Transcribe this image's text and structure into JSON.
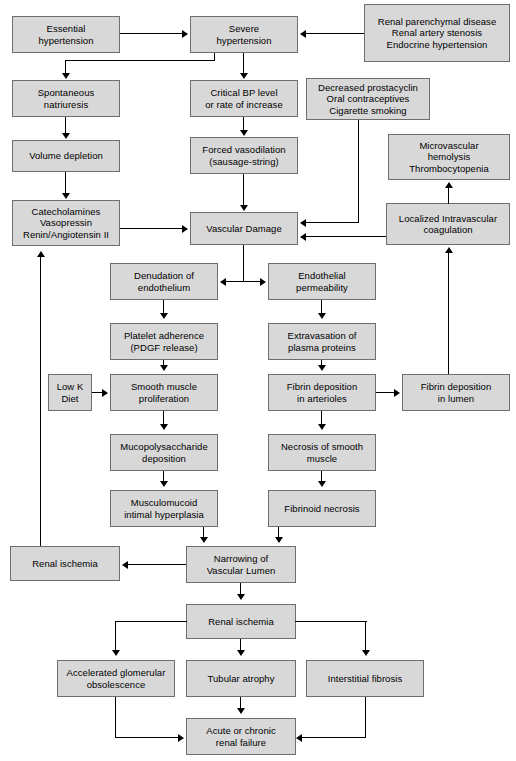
{
  "diagram": {
    "type": "flowchart",
    "canvas": {
      "width": 516,
      "height": 761
    },
    "style": {
      "node_fill": "#d8d8d8",
      "node_border": "#6e6e6e",
      "text_color": "#000000",
      "connector_color": "#000000",
      "background": "#ffffff"
    },
    "nodes": [
      {
        "id": "essential_hypertension",
        "label": "Essential\nhypertension",
        "lines": [
          "Essential",
          "hypertension"
        ]
      },
      {
        "id": "severe_hypertension",
        "label": "Severe\nhypertension",
        "lines": [
          "Severe",
          "hypertension"
        ]
      },
      {
        "id": "renal_causes",
        "label": "Renal parenchymal disease\nRenal artery stenosis\nEndocrine hypertension",
        "lines": [
          "Renal parenchymal disease",
          "Renal artery stenosis",
          "Endocrine hypertension"
        ]
      },
      {
        "id": "spontaneous_natriuresis",
        "label": "Spontaneous\nnatriuresis",
        "lines": [
          "Spontaneous",
          "natriuresis"
        ]
      },
      {
        "id": "critical_bp",
        "label": "Critical BP level\nor rate of increase",
        "lines": [
          "Critical BP level",
          "or rate of increase"
        ]
      },
      {
        "id": "decreased_prostacyclin",
        "label": "Decreased prostacyclin\nOral contraceptives\nCigarette smoking",
        "lines": [
          "Decreased prostacyclin",
          "Oral contraceptives",
          "Cigarette smoking"
        ]
      },
      {
        "id": "volume_depletion",
        "label": "Volume depletion",
        "lines": [
          "Volume depletion"
        ]
      },
      {
        "id": "forced_vasodilation",
        "label": "Forced vasodilation\n(sausage-string)",
        "lines": [
          "Forced vasodilation",
          "(sausage-string)"
        ]
      },
      {
        "id": "microvascular_hemolysis",
        "label": "Microvascular\nhemolysis\nThrombocytopenia",
        "lines": [
          "Microvascular",
          "hemolysis",
          "Thrombocytopenia"
        ]
      },
      {
        "id": "catecholamines",
        "label": "Catecholamines\nVasopressin\nRenin/Angiotensin II",
        "lines": [
          "Catecholamines",
          "Vasopressin",
          "Renin/Angiotensin II"
        ]
      },
      {
        "id": "vascular_damage",
        "label": "Vascular Damage",
        "lines": [
          "Vascular Damage"
        ]
      },
      {
        "id": "localized_intravascular_coagulation",
        "label": "Localized Intravascular\ncoagulation",
        "lines": [
          "Localized Intravascular",
          "coagulation"
        ]
      },
      {
        "id": "denudation_endothelium",
        "label": "Denudation of\nendothelium",
        "lines": [
          "Denudation of",
          "endothelium"
        ]
      },
      {
        "id": "endothelial_permeability",
        "label": "Endothelial\npermeability",
        "lines": [
          "Endothelial",
          "permeability"
        ]
      },
      {
        "id": "platelet_adherence",
        "label": "Platelet adherence\n(PDGF release)",
        "lines": [
          "Platelet adherence",
          "(PDGF release)"
        ]
      },
      {
        "id": "extravasation_plasma_proteins",
        "label": "Extravasation of\nplasma proteins",
        "lines": [
          "Extravasation of",
          "plasma proteins"
        ]
      },
      {
        "id": "low_k_diet",
        "label": "Low K\nDiet",
        "lines": [
          "Low K",
          "Diet"
        ]
      },
      {
        "id": "smooth_muscle_proliferation",
        "label": "Smooth muscle\nproliferation",
        "lines": [
          "Smooth muscle",
          "proliferation"
        ]
      },
      {
        "id": "fibrin_deposition_arterioles",
        "label": "Fibrin deposition\nin arterioles",
        "lines": [
          "Fibrin deposition",
          "in arterioles"
        ]
      },
      {
        "id": "fibrin_deposition_lumen",
        "label": "Fibrin deposition\nin lumen",
        "lines": [
          "Fibrin deposition",
          "in lumen"
        ]
      },
      {
        "id": "mucopolysaccharide_deposition",
        "label": "Mucopolysaccharide\ndeposition",
        "lines": [
          "Mucopolysaccharide",
          "deposition"
        ]
      },
      {
        "id": "necrosis_smooth_muscle",
        "label": "Necrosis of smooth\nmuscle",
        "lines": [
          "Necrosis of smooth",
          "muscle"
        ]
      },
      {
        "id": "musculomucoid_intimal_hyperplasia",
        "label": "Musculomucoid\nintimal hyperplasia",
        "lines": [
          "Musculomucoid",
          "intimal hyperplasia"
        ]
      },
      {
        "id": "fibrinoid_necrosis",
        "label": "Fibrinoid necrosis",
        "lines": [
          "Fibrinoid necrosis"
        ]
      },
      {
        "id": "renal_ischemia_left",
        "label": "Renal ischemia",
        "lines": [
          "Renal ischemia"
        ]
      },
      {
        "id": "narrowing_vascular_lumen",
        "label": "Narrowing of\nVascular Lumen",
        "lines": [
          "Narrowing of",
          "Vascular Lumen"
        ]
      },
      {
        "id": "renal_ischemia_center",
        "label": "Renal ischemia",
        "lines": [
          "Renal ischemia"
        ]
      },
      {
        "id": "accelerated_glomerular_obsolescence",
        "label": "Accelerated glomerular\nobsolescence",
        "lines": [
          "Accelerated glomerular",
          "obsolescence"
        ]
      },
      {
        "id": "tubular_atrophy",
        "label": "Tubular atrophy",
        "lines": [
          "Tubular atrophy"
        ]
      },
      {
        "id": "interstitial_fibrosis",
        "label": "Interstitial fibrosis",
        "lines": [
          "Interstitial fibrosis"
        ]
      },
      {
        "id": "acute_or_chronic_renal_failure",
        "label": "Acute or chronic\nrenal failure",
        "lines": [
          "Acute or chronic",
          "renal failure"
        ]
      }
    ],
    "edges": [
      {
        "from": "essential_hypertension",
        "to": "severe_hypertension"
      },
      {
        "from": "renal_causes",
        "to": "severe_hypertension"
      },
      {
        "from": "severe_hypertension",
        "to": "spontaneous_natriuresis"
      },
      {
        "from": "severe_hypertension",
        "to": "critical_bp"
      },
      {
        "from": "spontaneous_natriuresis",
        "to": "volume_depletion"
      },
      {
        "from": "critical_bp",
        "to": "forced_vasodilation"
      },
      {
        "from": "volume_depletion",
        "to": "catecholamines"
      },
      {
        "from": "forced_vasodilation",
        "to": "vascular_damage"
      },
      {
        "from": "catecholamines",
        "to": "vascular_damage"
      },
      {
        "from": "decreased_prostacyclin",
        "to": "vascular_damage"
      },
      {
        "from": "localized_intravascular_coagulation",
        "to": "vascular_damage"
      },
      {
        "from": "localized_intravascular_coagulation",
        "to": "microvascular_hemolysis"
      },
      {
        "from": "vascular_damage",
        "to": "denudation_endothelium"
      },
      {
        "from": "vascular_damage",
        "to": "endothelial_permeability"
      },
      {
        "from": "denudation_endothelium",
        "to": "platelet_adherence"
      },
      {
        "from": "endothelial_permeability",
        "to": "extravasation_plasma_proteins"
      },
      {
        "from": "platelet_adherence",
        "to": "smooth_muscle_proliferation"
      },
      {
        "from": "low_k_diet",
        "to": "smooth_muscle_proliferation"
      },
      {
        "from": "extravasation_plasma_proteins",
        "to": "fibrin_deposition_arterioles"
      },
      {
        "from": "fibrin_deposition_arterioles",
        "to": "fibrin_deposition_lumen"
      },
      {
        "from": "fibrin_deposition_lumen",
        "to": "localized_intravascular_coagulation"
      },
      {
        "from": "smooth_muscle_proliferation",
        "to": "mucopolysaccharide_deposition"
      },
      {
        "from": "fibrin_deposition_arterioles",
        "to": "necrosis_smooth_muscle"
      },
      {
        "from": "mucopolysaccharide_deposition",
        "to": "musculomucoid_intimal_hyperplasia"
      },
      {
        "from": "necrosis_smooth_muscle",
        "to": "fibrinoid_necrosis"
      },
      {
        "from": "musculomucoid_intimal_hyperplasia",
        "to": "narrowing_vascular_lumen"
      },
      {
        "from": "fibrinoid_necrosis",
        "to": "narrowing_vascular_lumen"
      },
      {
        "from": "narrowing_vascular_lumen",
        "to": "renal_ischemia_left"
      },
      {
        "from": "renal_ischemia_left",
        "to": "catecholamines"
      },
      {
        "from": "narrowing_vascular_lumen",
        "to": "renal_ischemia_center"
      },
      {
        "from": "renal_ischemia_center",
        "to": "accelerated_glomerular_obsolescence"
      },
      {
        "from": "renal_ischemia_center",
        "to": "tubular_atrophy"
      },
      {
        "from": "renal_ischemia_center",
        "to": "interstitial_fibrosis"
      },
      {
        "from": "accelerated_glomerular_obsolescence",
        "to": "acute_or_chronic_renal_failure"
      },
      {
        "from": "tubular_atrophy",
        "to": "acute_or_chronic_renal_failure"
      },
      {
        "from": "interstitial_fibrosis",
        "to": "acute_or_chronic_renal_failure"
      }
    ]
  }
}
